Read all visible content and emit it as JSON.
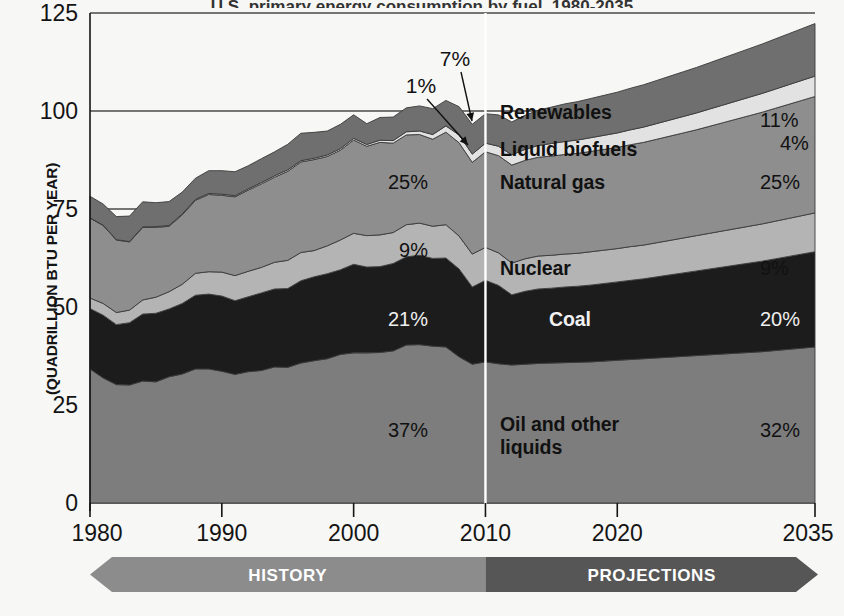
{
  "figure": {
    "title_partial": "U.S. primary energy consumption by fuel, 1980-2035",
    "ylabel": "(QUADRILLION BTU PER YEAR)",
    "history_band_label": "HISTORY",
    "projections_band_label": "PROJECTIONS",
    "divider_year": 2010
  },
  "axes": {
    "y_ticks": [
      "0",
      "25",
      "50",
      "75",
      "100",
      "125"
    ],
    "y_tick_values": [
      0,
      25,
      50,
      75,
      100,
      125
    ],
    "x_ticks": [
      "1980",
      "1990",
      "2000",
      "2010",
      "2020",
      "2035"
    ],
    "x_tick_values": [
      1980,
      1990,
      2000,
      2010,
      2020,
      2035
    ]
  },
  "colors": {
    "oil": "#7d7d7d",
    "coal": "#1c1c1c",
    "nuclear": "#b4b4b4",
    "natural_gas": "#8e8e8e",
    "liquid_biofuels": "#e2e2e2",
    "renewables": "#6f6f6f",
    "gridline": "#4a4a4a",
    "divider": "#ffffff",
    "history_band": "#8c8c8c",
    "projections_band": "#565656",
    "background": "#f7f7f5",
    "text": "#141414"
  },
  "series_labels": [
    {
      "name": "Renewables",
      "share_2010": "7%",
      "share_2035": "11%",
      "callout": true
    },
    {
      "name": "Liquid biofuels",
      "share_2010": "1%",
      "share_2035": "4%",
      "callout": true
    },
    {
      "name": "Natural gas",
      "share_2010": "25%",
      "share_2035": "25%",
      "callout": false
    },
    {
      "name": "Nuclear",
      "share_2010": "9%",
      "share_2035": "9%",
      "callout": false
    },
    {
      "name": "Coal",
      "share_2010": "21%",
      "share_2035": "20%",
      "callout": false
    },
    {
      "name": "Oil and other liquids",
      "share_2010": "37%",
      "share_2035": "32%",
      "callout": false
    }
  ],
  "chart_data": {
    "type": "area",
    "title": "U.S. primary energy consumption by fuel, 1980-2035",
    "xlabel": "",
    "ylabel": "(QUADRILLION BTU PER YEAR)",
    "xlim": [
      1980,
      2035
    ],
    "ylim": [
      0,
      125
    ],
    "grid": true,
    "legend_position": "in-plot-labels",
    "stacked": true,
    "stack_order_bottom_to_top": [
      "Oil and other liquids",
      "Coal",
      "Nuclear",
      "Natural gas",
      "Liquid biofuels",
      "Renewables"
    ],
    "x": [
      1980,
      1981,
      1982,
      1983,
      1984,
      1985,
      1986,
      1987,
      1988,
      1989,
      1990,
      1991,
      1992,
      1993,
      1994,
      1995,
      1996,
      1997,
      1998,
      1999,
      2000,
      2001,
      2002,
      2003,
      2004,
      2005,
      2006,
      2007,
      2008,
      2009,
      2010,
      2011,
      2012,
      2013,
      2014,
      2015,
      2016,
      2017,
      2018,
      2019,
      2020,
      2021,
      2022,
      2023,
      2024,
      2025,
      2026,
      2027,
      2028,
      2029,
      2030,
      2031,
      2032,
      2033,
      2034,
      2035
    ],
    "series": [
      {
        "name": "Oil and other liquids",
        "color": "#7d7d7d",
        "values": [
          34.2,
          31.9,
          30.2,
          30.1,
          31.1,
          30.9,
          32.2,
          32.9,
          34.2,
          34.2,
          33.6,
          32.8,
          33.5,
          33.8,
          34.7,
          34.6,
          35.7,
          36.3,
          36.8,
          37.9,
          38.3,
          38.3,
          38.4,
          38.8,
          40.3,
          40.4,
          40.0,
          39.8,
          37.3,
          35.4,
          36.0,
          35.5,
          35.2,
          35.4,
          35.6,
          35.7,
          35.8,
          35.9,
          36.0,
          36.2,
          36.4,
          36.6,
          36.8,
          37.0,
          37.2,
          37.4,
          37.6,
          37.8,
          38.0,
          38.2,
          38.4,
          38.6,
          38.9,
          39.2,
          39.5,
          39.8
        ]
      },
      {
        "name": "Coal",
        "color": "#1c1c1c",
        "values": [
          15.4,
          16.0,
          15.3,
          15.9,
          17.1,
          17.5,
          17.3,
          18.0,
          18.8,
          19.1,
          19.2,
          18.8,
          19.1,
          19.8,
          19.9,
          20.1,
          21.0,
          21.4,
          21.7,
          21.6,
          22.6,
          21.9,
          21.9,
          22.3,
          22.5,
          22.8,
          22.4,
          22.7,
          22.4,
          19.7,
          20.8,
          20.0,
          17.9,
          18.6,
          19.0,
          19.1,
          19.3,
          19.4,
          19.6,
          19.8,
          20.0,
          20.2,
          20.4,
          20.7,
          21.0,
          21.3,
          21.6,
          21.9,
          22.2,
          22.5,
          22.8,
          23.1,
          23.4,
          23.7,
          24.0,
          24.3
        ]
      },
      {
        "name": "Nuclear",
        "color": "#b4b4b4",
        "values": [
          2.7,
          3.0,
          3.1,
          3.2,
          3.6,
          4.1,
          4.4,
          4.9,
          5.6,
          5.7,
          6.1,
          6.4,
          6.5,
          6.5,
          6.8,
          7.2,
          7.2,
          6.7,
          7.1,
          7.6,
          7.9,
          8.0,
          8.1,
          7.9,
          8.2,
          8.2,
          8.2,
          8.5,
          8.4,
          8.4,
          8.4,
          8.3,
          8.1,
          8.3,
          8.4,
          8.4,
          8.4,
          8.4,
          8.5,
          8.5,
          8.5,
          8.6,
          8.6,
          8.7,
          8.8,
          8.9,
          9.0,
          9.1,
          9.2,
          9.3,
          9.4,
          9.5,
          9.6,
          9.7,
          9.8,
          9.9
        ]
      },
      {
        "name": "Natural gas",
        "color": "#8e8e8e",
        "values": [
          20.4,
          19.9,
          18.5,
          17.4,
          18.5,
          17.8,
          16.7,
          17.7,
          18.6,
          19.7,
          19.6,
          20.1,
          20.7,
          21.3,
          21.7,
          22.7,
          23.1,
          23.2,
          22.8,
          22.9,
          23.8,
          22.8,
          23.6,
          22.8,
          22.9,
          22.6,
          22.2,
          23.6,
          23.8,
          23.4,
          24.4,
          24.8,
          25.0,
          25.1,
          25.2,
          25.3,
          25.4,
          25.5,
          25.6,
          25.7,
          25.8,
          26.0,
          26.2,
          26.4,
          26.6,
          26.8,
          27.0,
          27.3,
          27.6,
          27.9,
          28.2,
          28.5,
          28.8,
          29.1,
          29.4,
          29.7
        ]
      },
      {
        "name": "Liquid biofuels",
        "color": "#e2e2e2",
        "values": [
          0.05,
          0.06,
          0.07,
          0.1,
          0.14,
          0.2,
          0.2,
          0.22,
          0.25,
          0.27,
          0.28,
          0.3,
          0.32,
          0.34,
          0.38,
          0.4,
          0.32,
          0.35,
          0.39,
          0.4,
          0.42,
          0.46,
          0.55,
          0.65,
          0.8,
          0.9,
          1.2,
          1.6,
          2.0,
          2.1,
          2.2,
          2.4,
          2.6,
          2.8,
          3.0,
          3.2,
          3.3,
          3.4,
          3.5,
          3.6,
          3.7,
          3.8,
          3.9,
          4.0,
          4.1,
          4.2,
          4.3,
          4.4,
          4.5,
          4.6,
          4.7,
          4.8,
          4.9,
          5.0,
          5.1,
          5.2
        ]
      },
      {
        "name": "Renewables",
        "color": "#6f6f6f",
        "values": [
          5.5,
          5.4,
          5.9,
          6.5,
          6.4,
          6.1,
          6.1,
          5.6,
          5.4,
          5.8,
          6.0,
          6.1,
          5.9,
          6.1,
          6.1,
          6.5,
          7.0,
          6.6,
          6.1,
          6.2,
          6.0,
          5.3,
          5.8,
          6.0,
          6.1,
          6.4,
          6.6,
          6.5,
          7.2,
          7.6,
          7.5,
          8.0,
          8.4,
          8.7,
          9.0,
          9.3,
          9.6,
          9.8,
          10.0,
          10.2,
          10.4,
          10.6,
          10.8,
          11.0,
          11.2,
          11.4,
          11.6,
          11.8,
          12.0,
          12.2,
          12.4,
          12.6,
          12.8,
          13.0,
          13.2,
          13.4
        ]
      }
    ]
  }
}
